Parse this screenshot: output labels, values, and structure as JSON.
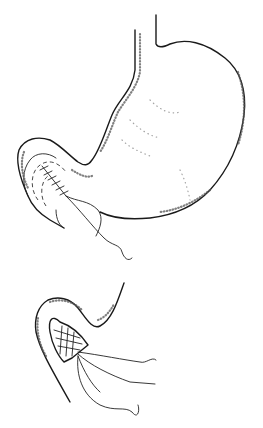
{
  "figure": {
    "panels": [
      {
        "name": "stomach-with-pyloric-suture"
      },
      {
        "name": "suture-cross-section-detail"
      }
    ],
    "colors": {
      "ink": "#1a1a1a",
      "background": "#ffffff"
    }
  }
}
